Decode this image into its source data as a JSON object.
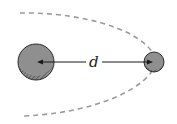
{
  "diagram": {
    "label_distance": "d",
    "colors": {
      "body_fill": "#8f8f8f",
      "outline": "#2a2a2a",
      "orbit": "#9a9a9a",
      "arrow": "#1a1a1a",
      "background": "#ffffff"
    },
    "large_body": {
      "cx": 36,
      "cy": 62,
      "r": 18
    },
    "small_body": {
      "cx": 154,
      "cy": 62,
      "r": 10
    },
    "orbit_style": "dashed"
  }
}
